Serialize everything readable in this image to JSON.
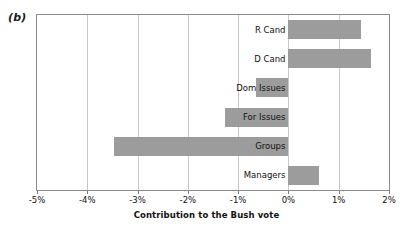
{
  "panel": {
    "letter": "(b)"
  },
  "chart_data": {
    "type": "bar",
    "orientation": "horizontal",
    "title": "",
    "subtitle": "",
    "xlabel": "Contribution to the Bush vote",
    "ylabel": "",
    "categories": [
      "R Cand",
      "D Cand",
      "Dom Issues",
      "For Issues",
      "Groups",
      "Managers"
    ],
    "values": [
      1.45,
      1.65,
      -0.65,
      -1.27,
      -3.47,
      0.6
    ],
    "value_unit": "%",
    "xlim": [
      -5,
      2
    ],
    "xticks": [
      -5,
      -4,
      -3,
      -2,
      -1,
      0,
      1,
      2
    ],
    "xtick_labels": [
      "-5%",
      "-4%",
      "-3%",
      "-2%",
      "-1%",
      "0%",
      "1%",
      "2%"
    ],
    "grid": "vertical",
    "legend": "none",
    "bar_color": "#9c9c9c",
    "frame_color": "#8b8b8b",
    "gridline_color": "#c9c9c9",
    "background": "#ffffff"
  }
}
